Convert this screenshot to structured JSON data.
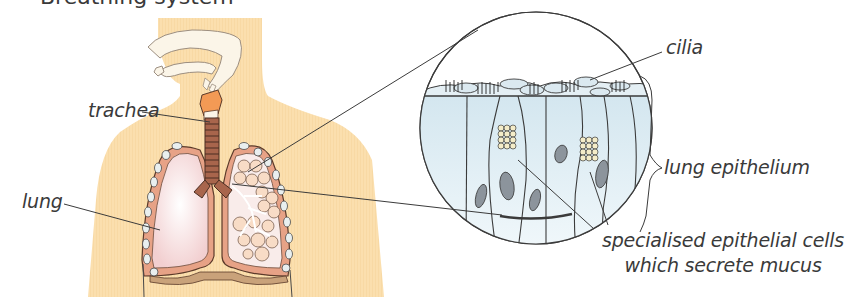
{
  "figure": {
    "title_cut_off": "Breathing system",
    "labels": {
      "trachea": "trachea",
      "lung": "lung",
      "cilia": "cilia",
      "lung_epithelium": "lung epithelium",
      "specialised_line1": "specialised epithelial cells",
      "specialised_line2": "which secrete mucus"
    },
    "colors": {
      "body": "#fbdfae",
      "lung_fill": "#f6dede",
      "lung_border": "#d9805e",
      "outline": "#3b3b3b",
      "alveoli": "#f7dcc4",
      "epithelium": "#dcebf1",
      "nucleus": "#8c949c",
      "mucus_granules": "#f4ecc8",
      "trachea": "#a8654c",
      "larynx": "#f09a5a",
      "airway": "#fbf5e8"
    }
  }
}
